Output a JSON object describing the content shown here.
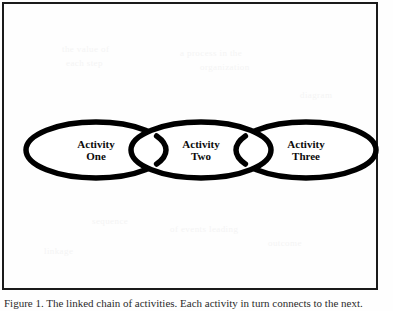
{
  "figure": {
    "frame": {
      "border_color": "#1a1a1a",
      "background_color": "#fefefe"
    },
    "diagram": {
      "type": "chain",
      "stroke_color": "#000000",
      "fill_color": "#ffffff",
      "stroke_width": 5.5,
      "nodes": [
        {
          "id": "activity-one",
          "line1": "Activity",
          "line2": "One",
          "cx": 96,
          "cy": 150,
          "rx": 70,
          "ry": 28
        },
        {
          "id": "activity-two",
          "line1": "Activity",
          "line2": "Two",
          "cx": 201,
          "cy": 150,
          "rx": 70,
          "ry": 28
        },
        {
          "id": "activity-three",
          "line1": "Activity",
          "line2": "Three",
          "cx": 306,
          "cy": 150,
          "rx": 70,
          "ry": 28
        }
      ],
      "links": [
        {
          "id": "link-one-two",
          "from": "activity-one",
          "to": "activity-two",
          "cx": 150
        },
        {
          "id": "link-two-three",
          "from": "activity-two",
          "to": "activity-three",
          "cx": 255
        }
      ]
    }
  },
  "caption": {
    "text": "Figure 1.  The linked chain of activities. Each activity in turn connects to the next."
  },
  "bleed_marks": [
    {
      "text": "the value of",
      "x": 62,
      "y": 44
    },
    {
      "text": "each step",
      "x": 66,
      "y": 58
    },
    {
      "text": "a process in the",
      "x": 180,
      "y": 48
    },
    {
      "text": "organization",
      "x": 200,
      "y": 62
    },
    {
      "text": "sequence",
      "x": 92,
      "y": 216
    },
    {
      "text": "of events leading",
      "x": 170,
      "y": 224
    },
    {
      "text": "outcome",
      "x": 268,
      "y": 238
    },
    {
      "text": "diagram",
      "x": 300,
      "y": 90
    },
    {
      "text": "linkage",
      "x": 44,
      "y": 246
    }
  ]
}
